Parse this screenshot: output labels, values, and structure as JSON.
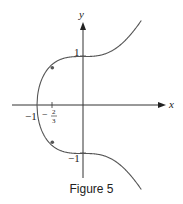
{
  "figure": {
    "caption": "Figure 5",
    "x_axis_label": "x",
    "y_axis_label": "y",
    "tick_labels": {
      "x_neg1": "−1",
      "x_neg23_num": "2",
      "x_neg23_den": "3",
      "x_neg23_sign": "−",
      "y_pos1": "1",
      "y_neg1": "−1"
    }
  },
  "chart_data": {
    "type": "line",
    "title": "Figure 5",
    "xlabel": "x",
    "ylabel": "y",
    "curve": "y^2 = x^3 + 1",
    "xlim": [
      -1.1,
      1.3
    ],
    "ylim": [
      -1.8,
      1.8
    ],
    "marked_points": [
      {
        "x": -1,
        "y": 0
      },
      {
        "x": 0,
        "y": 1
      },
      {
        "x": 0,
        "y": -1
      },
      {
        "x": -0.6667,
        "y": 0.7698
      },
      {
        "x": -0.6667,
        "y": -0.7698
      }
    ],
    "x_ticks": [
      -1,
      -0.6667
    ],
    "y_ticks": [
      1,
      -1
    ],
    "grid": false
  }
}
